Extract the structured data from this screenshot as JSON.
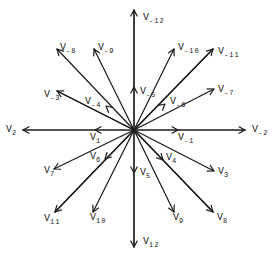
{
  "diagram": {
    "type": "vector-star",
    "center": [
      134,
      130
    ],
    "stroke_color": "#1a1a1a",
    "background": "#ffffff",
    "arrows": [
      {
        "id": "V_-12",
        "to": [
          134,
          10
        ],
        "head": "tip"
      },
      {
        "id": "V_12",
        "to": [
          134,
          247
        ],
        "head": "tip"
      },
      {
        "id": "V_2",
        "to": [
          23,
          130
        ],
        "head": "tip"
      },
      {
        "id": "V_-2",
        "to": [
          245,
          130
        ],
        "head": "tip"
      },
      {
        "id": "V_1",
        "to": [
          95,
          130
        ],
        "head": "mid",
        "line_to": [
          23,
          130
        ]
      },
      {
        "id": "V_-1",
        "to": [
          178,
          130
        ],
        "head": "mid",
        "line_to": [
          245,
          130
        ]
      },
      {
        "id": "V_-5",
        "to": [
          134,
          87
        ],
        "head": "mid",
        "line_to": [
          134,
          10
        ]
      },
      {
        "id": "V_5",
        "to": [
          134,
          173
        ],
        "head": "mid",
        "line_to": [
          134,
          247
        ]
      },
      {
        "id": "V_-8",
        "to": [
          57,
          49
        ],
        "head": "tip"
      },
      {
        "id": "V_-9",
        "to": [
          94,
          49
        ],
        "head": "tip"
      },
      {
        "id": "V_-3",
        "to": [
          57,
          91
        ],
        "head": "tip"
      },
      {
        "id": "V_-4",
        "to": [
          106,
          106
        ],
        "head": "mid",
        "line_to": [
          57,
          91
        ]
      },
      {
        "id": "V_-10",
        "to": [
          174,
          49
        ],
        "head": "tip"
      },
      {
        "id": "V_-11",
        "to": [
          213,
          49
        ],
        "head": "tip"
      },
      {
        "id": "V_-7",
        "to": [
          214,
          89
        ],
        "head": "tip"
      },
      {
        "id": "V_-6",
        "to": [
          165,
          104
        ],
        "head": "mid",
        "line_to": [
          213,
          49
        ]
      },
      {
        "id": "V_7",
        "to": [
          54,
          169
        ],
        "head": "tip"
      },
      {
        "id": "V_6",
        "to": [
          105,
          159
        ],
        "head": "mid",
        "line_to": [
          55,
          212
        ]
      },
      {
        "id": "V_11",
        "to": [
          55,
          212
        ],
        "head": "tip"
      },
      {
        "id": "V_10",
        "to": [
          93,
          212
        ],
        "head": "tip"
      },
      {
        "id": "V_3",
        "to": [
          214,
          171
        ],
        "head": "tip"
      },
      {
        "id": "V_4",
        "to": [
          163,
          160
        ],
        "head": "mid",
        "line_to": [
          213,
          212
        ]
      },
      {
        "id": "V_9",
        "to": [
          174,
          212
        ],
        "head": "tip"
      },
      {
        "id": "V_8",
        "to": [
          213,
          212
        ],
        "head": "tip"
      }
    ],
    "labels": [
      {
        "name": "V",
        "sub": "-12",
        "x": 143,
        "y": 13
      },
      {
        "name": "V",
        "sub": "12",
        "x": 143,
        "y": 237
      },
      {
        "name": "V",
        "sub": "2",
        "x": 6,
        "y": 125
      },
      {
        "name": "V",
        "sub": "-2",
        "x": 252,
        "y": 125
      },
      {
        "name": "V",
        "sub": "1",
        "x": 90,
        "y": 133
      },
      {
        "name": "V",
        "sub": "-1",
        "x": 178,
        "y": 133
      },
      {
        "name": "V",
        "sub": "-5",
        "x": 140,
        "y": 87
      },
      {
        "name": "V",
        "sub": "5",
        "x": 140,
        "y": 168
      },
      {
        "name": "V",
        "sub": "-8",
        "x": 60,
        "y": 43
      },
      {
        "name": "V",
        "sub": "-9",
        "x": 98,
        "y": 43
      },
      {
        "name": "V",
        "sub": "-3",
        "x": 44,
        "y": 90
      },
      {
        "name": "V",
        "sub": "-4",
        "x": 85,
        "y": 97
      },
      {
        "name": "V",
        "sub": "-10",
        "x": 178,
        "y": 43
      },
      {
        "name": "V",
        "sub": "-11",
        "x": 218,
        "y": 47
      },
      {
        "name": "V",
        "sub": "-7",
        "x": 218,
        "y": 85
      },
      {
        "name": "V",
        "sub": "-6",
        "x": 170,
        "y": 97
      },
      {
        "name": "V",
        "sub": "7",
        "x": 44,
        "y": 166
      },
      {
        "name": "V",
        "sub": "6",
        "x": 90,
        "y": 152
      },
      {
        "name": "V",
        "sub": "11",
        "x": 44,
        "y": 214
      },
      {
        "name": "V",
        "sub": "10",
        "x": 90,
        "y": 213
      },
      {
        "name": "V",
        "sub": "3",
        "x": 218,
        "y": 167
      },
      {
        "name": "V",
        "sub": "4",
        "x": 166,
        "y": 153
      },
      {
        "name": "V",
        "sub": "9",
        "x": 173,
        "y": 213
      },
      {
        "name": "V",
        "sub": "8",
        "x": 217,
        "y": 213
      }
    ]
  }
}
